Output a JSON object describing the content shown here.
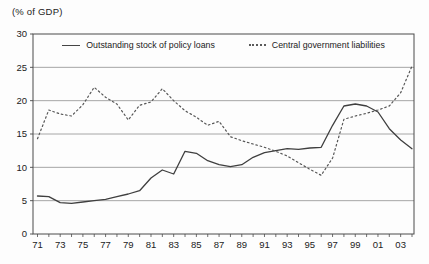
{
  "chart_data": {
    "type": "line",
    "title": "",
    "ylabel": "(% of GDP)",
    "xlabel": "",
    "ylim": [
      0,
      30
    ],
    "y_ticks": [
      0,
      5,
      10,
      15,
      20,
      25,
      30
    ],
    "x_tick_labels": [
      "71",
      "73",
      "75",
      "77",
      "79",
      "81",
      "83",
      "85",
      "87",
      "89",
      "91",
      "93",
      "95",
      "97",
      "99",
      "01",
      "03"
    ],
    "x": [
      1971,
      1972,
      1973,
      1974,
      1975,
      1976,
      1977,
      1978,
      1979,
      1980,
      1981,
      1982,
      1983,
      1984,
      1985,
      1986,
      1987,
      1988,
      1989,
      1990,
      1991,
      1992,
      1993,
      1994,
      1995,
      1996,
      1997,
      1998,
      1999,
      2000,
      2001,
      2002,
      2003,
      2004
    ],
    "grid": "horizontal",
    "legend_position": "top-inside",
    "frame_color": "#4a4a4a",
    "gridline_color": "#8f8f8f",
    "text_color": "#222222",
    "series": [
      {
        "name": "Outstanding stock of policy loans",
        "style": "solid",
        "color": "#3f3f3f",
        "values": [
          5.7,
          5.6,
          4.7,
          4.6,
          4.8,
          5.0,
          5.2,
          5.6,
          6.0,
          6.5,
          8.4,
          9.6,
          9.0,
          12.4,
          12.1,
          11.0,
          10.4,
          10.1,
          10.4,
          11.5,
          12.2,
          12.5,
          12.8,
          12.7,
          12.9,
          13.0,
          16.3,
          19.2,
          19.5,
          19.2,
          18.3,
          15.8,
          14.1,
          12.8
        ]
      },
      {
        "name": "Central government liabilities",
        "style": "dotted",
        "color": "#565656",
        "values": [
          14.3,
          18.6,
          18.0,
          17.7,
          19.4,
          22.0,
          20.5,
          19.5,
          17.1,
          19.3,
          19.8,
          21.8,
          20.0,
          18.5,
          17.5,
          16.3,
          16.9,
          14.6,
          14.0,
          13.5,
          13.0,
          12.4,
          11.7,
          10.7,
          9.7,
          8.8,
          11.4,
          17.2,
          17.7,
          18.1,
          18.6,
          19.2,
          21.2,
          25.2
        ]
      }
    ]
  }
}
